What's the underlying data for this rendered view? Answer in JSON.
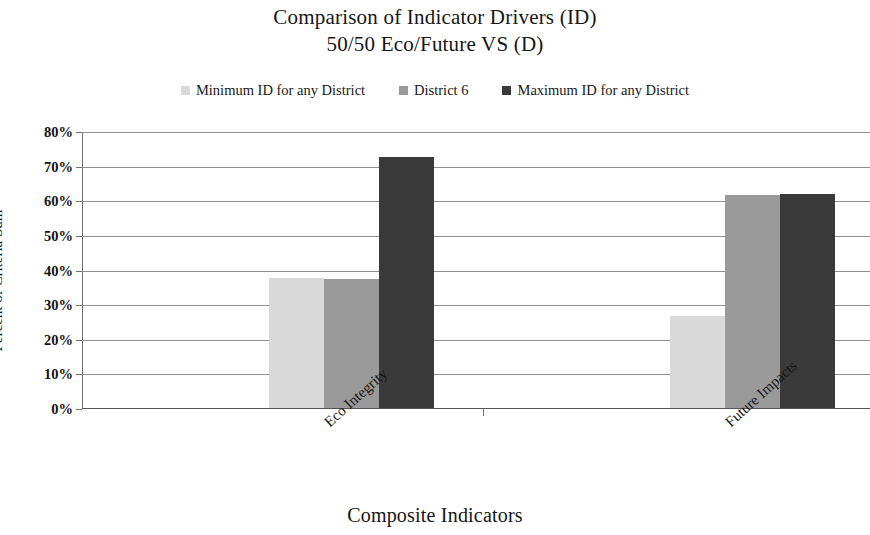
{
  "chart_data": {
    "type": "bar",
    "title": "Comparison of Indicator Drivers (ID)",
    "subtitle": "50/50 Eco/Future VS (D)",
    "xlabel": "Composite Indicators",
    "ylabel": "Percent of Criteria Sum",
    "categories": [
      "Eco Integrity",
      "Future Impacts"
    ],
    "series": [
      {
        "name": "Minimum ID for any District",
        "color": "#d9d9d9",
        "values": [
          37.5,
          26.5
        ]
      },
      {
        "name": "District 6",
        "color": "#9a9a9a",
        "values": [
          37.3,
          61.5
        ]
      },
      {
        "name": "Maximum ID for any District",
        "color": "#3a3a3a",
        "values": [
          72.5,
          61.8
        ]
      }
    ],
    "ylim": [
      0,
      80
    ],
    "ytick_labels": [
      "80%",
      "70%",
      "60%",
      "50%",
      "40%",
      "30%",
      "20%",
      "10%",
      "0%"
    ],
    "ytick_values": [
      80,
      70,
      60,
      50,
      40,
      30,
      20,
      10,
      0
    ],
    "grid": true,
    "legend_position": "top"
  }
}
